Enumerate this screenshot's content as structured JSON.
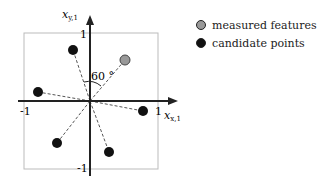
{
  "axes": {
    "x_label": "x",
    "x_sub": "x,1",
    "y_label": "x",
    "y_sub": "y,1",
    "ticks": {
      "x_neg": "-1",
      "x_pos": "1",
      "y_pos": "1",
      "y_neg": "-1"
    }
  },
  "angle_label": "60 °",
  "legend": [
    {
      "label": "measured features",
      "color": "#999999"
    },
    {
      "label": "candidate points",
      "color": "#111111"
    }
  ],
  "points": {
    "measured": [
      {
        "x": 0.52,
        "y": 0.61
      }
    ],
    "candidates": [
      {
        "x": -0.25,
        "y": 0.76
      },
      {
        "x": -0.78,
        "y": 0.13
      },
      {
        "x": 0.79,
        "y": -0.15
      },
      {
        "x": -0.49,
        "y": -0.62
      },
      {
        "x": 0.28,
        "y": -0.76
      }
    ]
  }
}
